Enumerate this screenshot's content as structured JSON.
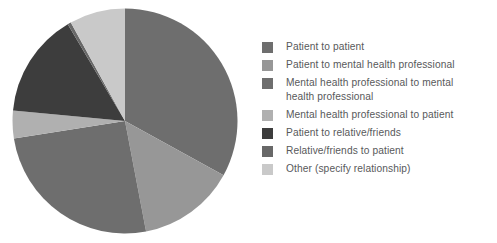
{
  "chart_data": {
    "type": "pie",
    "title": "",
    "subtitle": "",
    "xlabel": "",
    "ylabel": "",
    "grid": false,
    "legend_position": "right",
    "start_angle_deg": 0,
    "direction": "clockwise",
    "categories": [
      "Patient to patient",
      "Patient to mental health professional",
      "Mental health professional to mental health professional",
      "Mental health professional to patient",
      "Patient to relative/friends",
      "Relative/friends to patient",
      "Other (specify relationship)"
    ],
    "values": [
      33,
      14,
      25.5,
      4,
      15,
      0.5,
      8
    ],
    "unit": "percent",
    "colors": [
      "#6e6e6e",
      "#979797",
      "#6e6e6e",
      "#b0b0b0",
      "#3d3d3d",
      "#686868",
      "#c9c9c9"
    ],
    "annotations": []
  },
  "legend": {
    "items": [
      {
        "label": "Patient to patient",
        "color": "#6e6e6e"
      },
      {
        "label": "Patient to mental health professional",
        "color": "#979797"
      },
      {
        "label": "Mental health professional to mental\nhealth professional",
        "color": "#6e6e6e"
      },
      {
        "label": "Mental health professional to patient",
        "color": "#b0b0b0"
      },
      {
        "label": "Patient to relative/friends",
        "color": "#3d3d3d"
      },
      {
        "label": "Relative/friends to patient",
        "color": "#686868"
      },
      {
        "label": "Other (specify relationship)",
        "color": "#c9c9c9"
      }
    ]
  },
  "colors": {
    "background": "#ffffff",
    "legend_text": "#58595b"
  }
}
